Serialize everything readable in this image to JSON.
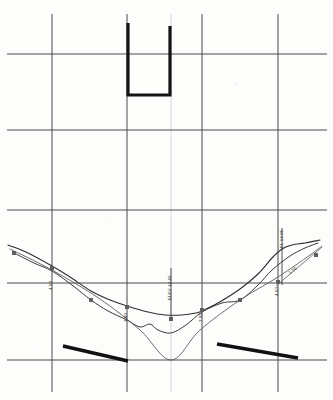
{
  "document": {
    "kind": "engineering-profile-drawing",
    "title": "",
    "background_color": "#fdfdfc",
    "width": 333,
    "height": 400
  },
  "grid": {
    "line_color": "#4a4a4a",
    "line_width": 1,
    "faint_line_color": "#d8d8d8",
    "extent": {
      "x0": 7,
      "x1": 327,
      "y0": 14,
      "y1": 392
    },
    "vertical_x": [
      52,
      127,
      202,
      278
    ],
    "faint_vertical_x": [
      171
    ],
    "horizontal_y": [
      54,
      130,
      210,
      283,
      360
    ]
  },
  "structure": {
    "name": "u-channel-section",
    "color": "#141414",
    "stroke_width": 3.2,
    "points": [
      {
        "x": 128,
        "y": 23
      },
      {
        "x": 128,
        "y": 95
      },
      {
        "x": 170,
        "y": 95
      },
      {
        "x": 170,
        "y": 26
      }
    ]
  },
  "curves": [
    {
      "name": "upper-profile-line",
      "color": "#2e2e2e",
      "stroke_width": 1.1,
      "marker": "none",
      "points": [
        {
          "x": 8,
          "y": 245
        },
        {
          "x": 26,
          "y": 252
        },
        {
          "x": 52,
          "y": 266
        },
        {
          "x": 70,
          "y": 277
        },
        {
          "x": 91,
          "y": 291
        },
        {
          "x": 110,
          "y": 300
        },
        {
          "x": 127,
          "y": 306
        },
        {
          "x": 148,
          "y": 312
        },
        {
          "x": 165,
          "y": 315
        },
        {
          "x": 182,
          "y": 315
        },
        {
          "x": 196,
          "y": 313
        },
        {
          "x": 202,
          "y": 311
        },
        {
          "x": 218,
          "y": 303
        },
        {
          "x": 240,
          "y": 289
        },
        {
          "x": 258,
          "y": 274
        },
        {
          "x": 272,
          "y": 258
        },
        {
          "x": 282,
          "y": 249
        },
        {
          "x": 292,
          "y": 245
        },
        {
          "x": 305,
          "y": 243
        },
        {
          "x": 320,
          "y": 240
        }
      ]
    },
    {
      "name": "middle-profile-line",
      "color": "#3a3a3a",
      "stroke_width": 1.0,
      "marker": "none",
      "points": [
        {
          "x": 14,
          "y": 253
        },
        {
          "x": 34,
          "y": 263
        },
        {
          "x": 52,
          "y": 271
        },
        {
          "x": 72,
          "y": 285
        },
        {
          "x": 91,
          "y": 300
        },
        {
          "x": 108,
          "y": 311
        },
        {
          "x": 127,
          "y": 320
        },
        {
          "x": 140,
          "y": 327
        },
        {
          "x": 150,
          "y": 324
        },
        {
          "x": 158,
          "y": 330
        },
        {
          "x": 171,
          "y": 333
        },
        {
          "x": 186,
          "y": 325
        },
        {
          "x": 202,
          "y": 312
        },
        {
          "x": 222,
          "y": 303
        },
        {
          "x": 240,
          "y": 300
        },
        {
          "x": 258,
          "y": 285
        },
        {
          "x": 272,
          "y": 270
        },
        {
          "x": 290,
          "y": 256
        },
        {
          "x": 305,
          "y": 248
        },
        {
          "x": 318,
          "y": 243
        }
      ]
    },
    {
      "name": "v-datum-line",
      "color": "#5c5c5c",
      "stroke_width": 0.9,
      "marker": "none",
      "points": [
        {
          "x": 10,
          "y": 249
        },
        {
          "x": 52,
          "y": 270
        },
        {
          "x": 100,
          "y": 299
        },
        {
          "x": 140,
          "y": 330
        },
        {
          "x": 171,
          "y": 360
        },
        {
          "x": 200,
          "y": 330
        },
        {
          "x": 240,
          "y": 300
        },
        {
          "x": 278,
          "y": 277
        },
        {
          "x": 310,
          "y": 255
        },
        {
          "x": 322,
          "y": 246
        }
      ]
    }
  ],
  "markers": {
    "name": "station-markers",
    "color": "#5f5f5f",
    "size": 4,
    "points": [
      {
        "x": 14,
        "y": 253,
        "label": ""
      },
      {
        "x": 52,
        "y": 268,
        "label": ""
      },
      {
        "x": 91,
        "y": 300,
        "label": ""
      },
      {
        "x": 127,
        "y": 307,
        "label": ""
      },
      {
        "x": 171,
        "y": 319,
        "label": ""
      },
      {
        "x": 202,
        "y": 310,
        "label": ""
      },
      {
        "x": 240,
        "y": 300,
        "label": ""
      },
      {
        "x": 278,
        "y": 282,
        "label": ""
      },
      {
        "x": 316,
        "y": 255,
        "label": ""
      }
    ]
  },
  "thick_segments": [
    {
      "name": "left-tie-bar",
      "color": "#111111",
      "stroke_width": 3.4,
      "x1": 63,
      "y1": 346,
      "x2": 128,
      "y2": 361
    },
    {
      "name": "right-tie-bar",
      "color": "#111111",
      "stroke_width": 3.4,
      "x1": 217,
      "y1": 344,
      "x2": 298,
      "y2": 358
    }
  ],
  "callouts": [
    {
      "name": "leader-center",
      "color": "#3a3a3a",
      "x1": 171,
      "y1": 268,
      "x2": 171,
      "y2": 318
    },
    {
      "name": "leader-right",
      "color": "#3a3a3a",
      "x1": 282,
      "y1": 228,
      "x2": 282,
      "y2": 285
    },
    {
      "name": "leader-right-diagonal",
      "color": "#6a6a6a",
      "x1": 276,
      "y1": 286,
      "x2": 322,
      "y2": 247
    }
  ],
  "labels": [
    {
      "name": "label-station-left",
      "text": "4.50",
      "x": 49,
      "y": 290,
      "rotation": -90
    },
    {
      "name": "label-station-mid-left",
      "text": "3.80",
      "x": 124,
      "y": 322,
      "rotation": -90
    },
    {
      "name": "label-center-elevation",
      "text": "ELEV 12.40",
      "x": 168,
      "y": 300,
      "rotation": -90
    },
    {
      "name": "label-station-mid-right",
      "text": "3.95",
      "x": 199,
      "y": 322,
      "rotation": -90
    },
    {
      "name": "label-station-right",
      "text": "4.60",
      "x": 275,
      "y": 296,
      "rotation": -90
    },
    {
      "name": "label-right-top",
      "text": "EL 14.85",
      "x": 280,
      "y": 248,
      "rotation": -90
    },
    {
      "name": "label-slope-right",
      "text": "1:50",
      "x": 288,
      "y": 272,
      "rotation": -38
    }
  ]
}
